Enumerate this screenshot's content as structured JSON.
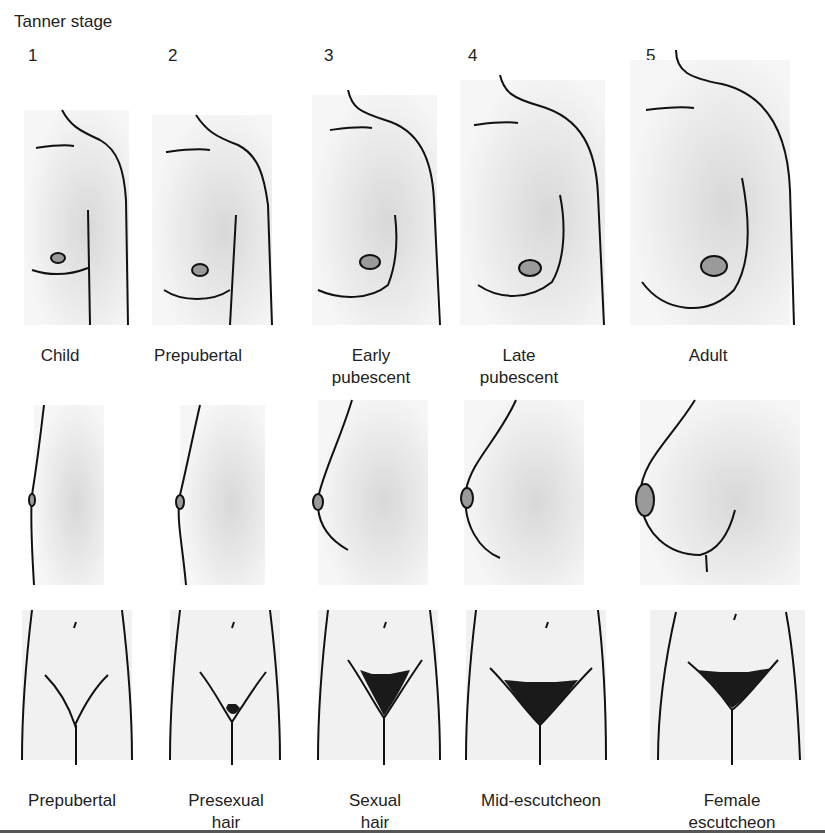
{
  "figure": {
    "title": "Tanner stage",
    "stages": [
      {
        "number": "1",
        "breast_label": "Child",
        "pubic_label": "Prepubertal"
      },
      {
        "number": "2",
        "breast_label": "Prepubertal",
        "pubic_label": "Presexual hair"
      },
      {
        "number": "3",
        "breast_label": "Early pubescent",
        "pubic_label": "Sexual hair"
      },
      {
        "number": "4",
        "breast_label": "Late pubescent",
        "pubic_label": "Mid-escutcheon"
      },
      {
        "number": "5",
        "breast_label": "Adult",
        "pubic_label": "Female escutcheon"
      }
    ],
    "rows": [
      "Breast (frontal view)",
      "Breast (lateral view)",
      "Pubic hair"
    ],
    "colors": {
      "line": "#111111",
      "shade": "#e6e6e6",
      "areola": "#9a9a9a",
      "hair": "#1a1a1a"
    }
  }
}
